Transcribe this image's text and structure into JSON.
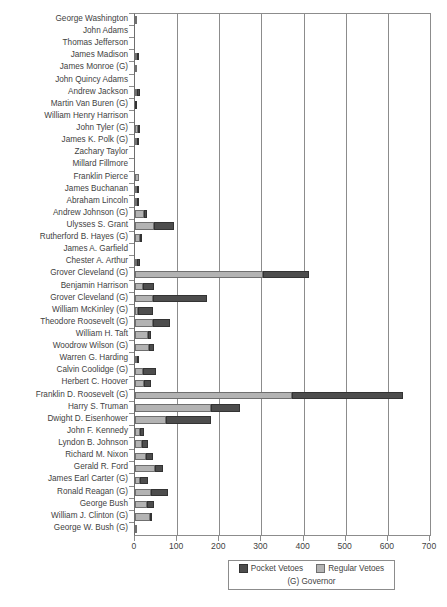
{
  "chart_data": {
    "type": "bar",
    "orientation": "horizontal",
    "stacked": true,
    "title": "",
    "subtitle": "",
    "xlabel": "",
    "ylabel": "",
    "xlim": [
      0,
      700
    ],
    "xticks": [
      0,
      100,
      200,
      300,
      400,
      500,
      600,
      700
    ],
    "xtick_labels": [
      "0",
      "100",
      "200",
      "300",
      "400",
      "500",
      "600",
      "700"
    ],
    "grid": true,
    "grid_axis": "x",
    "legend": {
      "position": "bottom-right",
      "entries": [
        {
          "label": "Pocket Vetoes",
          "color": "#4d4d4d",
          "key": "pocket"
        },
        {
          "label": "Regular Vetoes",
          "color": "#b3b3b3",
          "key": "regular"
        }
      ],
      "note": "(G) Governor"
    },
    "series": [
      {
        "name": "Regular Vetoes",
        "key": "regular",
        "color": "#b3b3b3"
      },
      {
        "name": "Pocket Vetoes",
        "key": "pocket",
        "color": "#4d4d4d"
      }
    ],
    "categories": [
      "George Washington",
      "John Adams",
      "Thomas Jefferson",
      "James Madison",
      "James Monroe (G)",
      "John Quincy Adams",
      "Andrew Jackson",
      "Martin Van Buren (G)",
      "William Henry Harrison",
      "John Tyler (G)",
      "James K. Polk (G)",
      "Zachary Taylor",
      "Millard Fillmore",
      "Franklin Pierce",
      "James Buchanan",
      "Abraham Lincoln",
      "Andrew Johnson (G)",
      "Ulysses S. Grant",
      "Rutherford B. Hayes (G)",
      "James A. Garfield",
      "Chester A. Arthur",
      "Grover Cleveland (G)",
      "Benjamin Harrison",
      "Grover Cleveland (G)",
      "William McKinley (G)",
      "Theodore Roosevelt (G)",
      "William H. Taft",
      "Woodrow Wilson (G)",
      "Warren G. Harding",
      "Calvin Coolidge (G)",
      "Herbert C. Hoover",
      "Franklin D. Roosevelt (G)",
      "Harry S. Truman",
      "Dwight D. Eisenhower",
      "John F. Kennedy",
      "Lyndon B. Johnson",
      "Richard M. Nixon",
      "Gerald R. Ford",
      "James Earl Carter (G)",
      "Ronald Reagan (G)",
      "George Bush",
      "William J. Clinton (G)",
      "George W. Bush (G)"
    ],
    "data": [
      {
        "category": "George Washington",
        "regular": 2,
        "pocket": 0,
        "total": 2
      },
      {
        "category": "John Adams",
        "regular": 0,
        "pocket": 0,
        "total": 0
      },
      {
        "category": "Thomas Jefferson",
        "regular": 0,
        "pocket": 0,
        "total": 0
      },
      {
        "category": "James Madison",
        "regular": 5,
        "pocket": 2,
        "total": 7
      },
      {
        "category": "James Monroe (G)",
        "regular": 1,
        "pocket": 0,
        "total": 1
      },
      {
        "category": "John Quincy Adams",
        "regular": 0,
        "pocket": 0,
        "total": 0
      },
      {
        "category": "Andrew Jackson",
        "regular": 5,
        "pocket": 7,
        "total": 12
      },
      {
        "category": "Martin Van Buren (G)",
        "regular": 0,
        "pocket": 1,
        "total": 1
      },
      {
        "category": "William Henry Harrison",
        "regular": 0,
        "pocket": 0,
        "total": 0
      },
      {
        "category": "John Tyler (G)",
        "regular": 6,
        "pocket": 4,
        "total": 10
      },
      {
        "category": "James K. Polk (G)",
        "regular": 2,
        "pocket": 1,
        "total": 3
      },
      {
        "category": "Zachary Taylor",
        "regular": 0,
        "pocket": 0,
        "total": 0
      },
      {
        "category": "Millard Fillmore",
        "regular": 0,
        "pocket": 0,
        "total": 0
      },
      {
        "category": "Franklin Pierce",
        "regular": 9,
        "pocket": 0,
        "total": 9
      },
      {
        "category": "James Buchanan",
        "regular": 4,
        "pocket": 3,
        "total": 7
      },
      {
        "category": "Abraham Lincoln",
        "regular": 2,
        "pocket": 5,
        "total": 7
      },
      {
        "category": "Andrew Johnson (G)",
        "regular": 21,
        "pocket": 8,
        "total": 29
      },
      {
        "category": "Ulysses S. Grant",
        "regular": 45,
        "pocket": 48,
        "total": 93
      },
      {
        "category": "Rutherford B. Hayes (G)",
        "regular": 12,
        "pocket": 1,
        "total": 13
      },
      {
        "category": "James A. Garfield",
        "regular": 0,
        "pocket": 0,
        "total": 0
      },
      {
        "category": "Chester A. Arthur",
        "regular": 4,
        "pocket": 8,
        "total": 12
      },
      {
        "category": "Grover Cleveland (G)",
        "regular": 304,
        "pocket": 110,
        "total": 414
      },
      {
        "category": "Benjamin Harrison",
        "regular": 19,
        "pocket": 25,
        "total": 44
      },
      {
        "category": "Grover Cleveland (G)",
        "regular": 42,
        "pocket": 128,
        "total": 170
      },
      {
        "category": "William McKinley (G)",
        "regular": 6,
        "pocket": 36,
        "total": 42
      },
      {
        "category": "Theodore Roosevelt (G)",
        "regular": 42,
        "pocket": 40,
        "total": 82
      },
      {
        "category": "William H. Taft",
        "regular": 30,
        "pocket": 9,
        "total": 39
      },
      {
        "category": "Woodrow Wilson (G)",
        "regular": 33,
        "pocket": 11,
        "total": 44
      },
      {
        "category": "Warren G. Harding",
        "regular": 5,
        "pocket": 1,
        "total": 6
      },
      {
        "category": "Calvin Coolidge (G)",
        "regular": 20,
        "pocket": 30,
        "total": 50
      },
      {
        "category": "Herbert C. Hoover",
        "regular": 21,
        "pocket": 16,
        "total": 37
      },
      {
        "category": "Franklin D. Roosevelt (G)",
        "regular": 372,
        "pocket": 263,
        "total": 635
      },
      {
        "category": "Harry S. Truman",
        "regular": 180,
        "pocket": 70,
        "total": 250
      },
      {
        "category": "Dwight D. Eisenhower",
        "regular": 73,
        "pocket": 108,
        "total": 181
      },
      {
        "category": "John F. Kennedy",
        "regular": 12,
        "pocket": 9,
        "total": 21
      },
      {
        "category": "Lyndon B. Johnson",
        "regular": 16,
        "pocket": 14,
        "total": 30
      },
      {
        "category": "Richard M. Nixon",
        "regular": 26,
        "pocket": 17,
        "total": 43
      },
      {
        "category": "Gerald R. Ford",
        "regular": 48,
        "pocket": 18,
        "total": 66
      },
      {
        "category": "James Earl Carter (G)",
        "regular": 13,
        "pocket": 18,
        "total": 31
      },
      {
        "category": "Ronald Reagan (G)",
        "regular": 39,
        "pocket": 39,
        "total": 78
      },
      {
        "category": "George Bush",
        "regular": 29,
        "pocket": 15,
        "total": 44
      },
      {
        "category": "William J. Clinton (G)",
        "regular": 36,
        "pocket": 1,
        "total": 37
      },
      {
        "category": "George W. Bush (G)",
        "regular": 4,
        "pocket": 0,
        "total": 4
      }
    ]
  }
}
